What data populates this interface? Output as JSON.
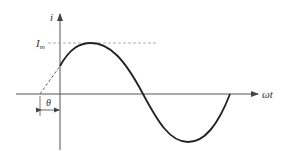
{
  "diagram": {
    "labels": {
      "y_axis": "i",
      "x_axis": "ωt",
      "amplitude": "I",
      "amplitude_sub": "m",
      "phase": "θ"
    },
    "colors": {
      "curve": "#222222",
      "axis": "#555555",
      "dashed": "#888888"
    }
  }
}
